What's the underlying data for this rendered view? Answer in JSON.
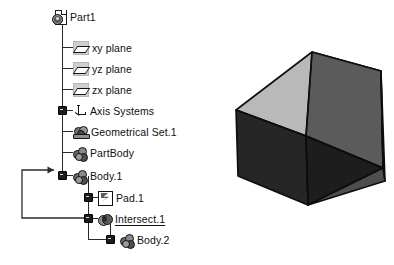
{
  "app": {
    "view_name": "CATIA specification tree and 3D viewer"
  },
  "tree": {
    "root": {
      "label": "Part1",
      "icon": "part-document-icon"
    },
    "items": [
      {
        "label": "xy plane",
        "icon": "plane-icon",
        "expandable": false,
        "underline": false
      },
      {
        "label": "yz plane",
        "icon": "plane-icon",
        "expandable": false,
        "underline": false
      },
      {
        "label": "zx plane",
        "icon": "plane-icon",
        "expandable": false,
        "underline": false
      },
      {
        "label": "Axis Systems",
        "icon": "axis-system-icon",
        "expandable": true,
        "underline": false
      },
      {
        "label": "Geometrical Set.1",
        "icon": "geometrical-set-icon",
        "expandable": false,
        "underline": false
      },
      {
        "label": "PartBody",
        "icon": "body-icon",
        "expandable": false,
        "underline": false
      },
      {
        "label": "Body.1",
        "icon": "body-icon",
        "expandable": true,
        "underline": false
      },
      {
        "label": "Pad.1",
        "icon": "pad-icon",
        "expandable": true,
        "underline": false
      },
      {
        "label": "Intersect.1",
        "icon": "intersect-icon",
        "expandable": true,
        "underline": true
      },
      {
        "label": "Body.2",
        "icon": "body-icon",
        "expandable": true,
        "underline": false
      }
    ],
    "relation_arrow": {
      "name": "intersect-to-body1-link-arrow",
      "from": "Intersect.1",
      "to": "Body.1"
    }
  },
  "viewer": {
    "model_name": "intersected-solid",
    "faces": [
      {
        "name": "top-face",
        "color": "#b9b9b9"
      },
      {
        "name": "upper-right-face",
        "color": "#5b5b5b"
      },
      {
        "name": "front-left-face",
        "color": "#262626"
      },
      {
        "name": "front-triangle-face",
        "color": "#1d1d1d"
      },
      {
        "name": "lower-right-face",
        "color": "#4e4e4e"
      },
      {
        "name": "right-edge-face",
        "color": "#1a1a1a"
      }
    ],
    "outline_color": "#0d0d0d"
  },
  "colors": {
    "background": "#ffffff",
    "tree_line": "#2a2a2a",
    "text": "#101010"
  }
}
